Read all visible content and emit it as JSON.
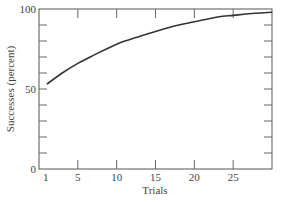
{
  "chart_data": {
    "type": "line",
    "title": "",
    "xlabel": "Trials",
    "ylabel": "Successes (percent)",
    "xlim": [
      0,
      30
    ],
    "ylim": [
      0,
      100
    ],
    "x_ticks": [
      1,
      5,
      10,
      15,
      20,
      25
    ],
    "y_ticks_labeled": [
      0,
      50,
      100
    ],
    "y_minor_step": 10,
    "grid": false,
    "legend": null,
    "series": [
      {
        "name": "Learning curve",
        "x": [
          1,
          3,
          5,
          7,
          10,
          13,
          15,
          18,
          20,
          23,
          25,
          27,
          30
        ],
        "y": [
          53,
          60,
          66,
          71,
          78,
          83,
          86,
          90,
          92,
          95,
          96,
          97,
          98
        ]
      }
    ]
  },
  "axes": {
    "x_label": "Trials",
    "y_label": "Successes (percent)",
    "x_tick_labels": [
      "1",
      "5",
      "10",
      "15",
      "20",
      "25"
    ],
    "y_tick_labels": [
      "0",
      "50",
      "100"
    ]
  }
}
